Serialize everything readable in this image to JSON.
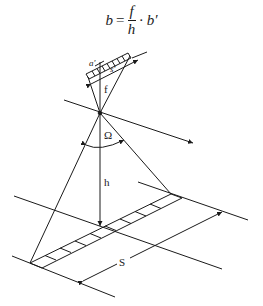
{
  "formula": {
    "lhs": "b",
    "equals": "=",
    "numerator": "f",
    "denominator": "h",
    "dot": "·",
    "rhs": "b′"
  },
  "labels": {
    "detector_pixel": "a′",
    "detector_length": "s′",
    "focal_length": "f",
    "field_of_view": "Ω",
    "height": "h",
    "swath_width": "S"
  },
  "colors": {
    "line": "#1a1a1a",
    "background": "#ffffff"
  }
}
